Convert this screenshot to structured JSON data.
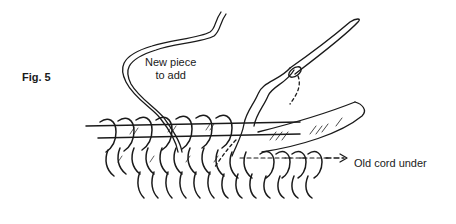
{
  "figure": {
    "label": "Fig. 5",
    "annotations": {
      "new_piece": [
        "New piece",
        "to add"
      ],
      "old_cord": "Old cord under"
    },
    "colors": {
      "ink": "#1a1a1a",
      "background": "#ffffff"
    }
  }
}
